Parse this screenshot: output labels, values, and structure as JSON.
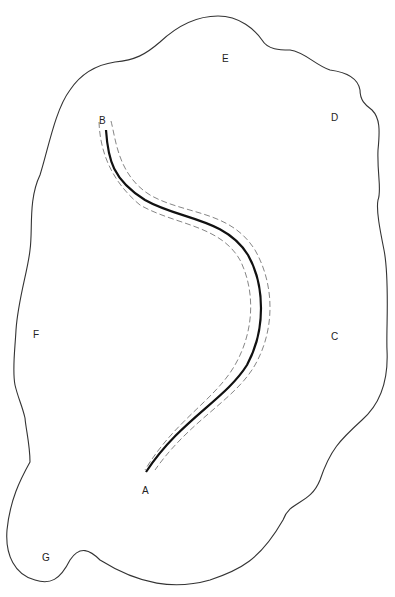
{
  "diagram": {
    "labels": {
      "A": "A",
      "B": "B",
      "C": "C",
      "D": "D",
      "E": "E",
      "F": "F",
      "G": "G"
    },
    "colors": {
      "outline": "#333333",
      "path": "#111111",
      "buffer": "#777777",
      "background": "#ffffff"
    }
  }
}
